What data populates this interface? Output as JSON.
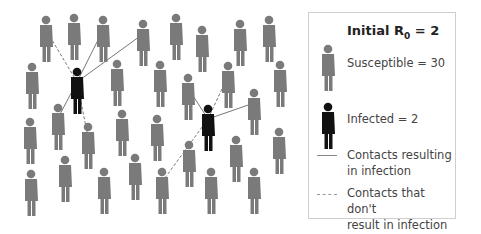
{
  "legend": {
    "title_prefix": "Initial R",
    "title_sub": "0",
    "title_suffix": " = 2",
    "susceptible_label": "Susceptible = 30",
    "infected_label": "Infected = 2",
    "solid_line_label_1": "Contacts resulting",
    "solid_line_label_2": "in infection",
    "dashed_line_label_1": "Contacts that don't",
    "dashed_line_label_2": "result in infection"
  },
  "colors": {
    "susceptible": "#7a7a7a",
    "infected": "#111111",
    "line": "#777777"
  },
  "susceptible_people": [
    [
      46,
      20
    ],
    [
      74,
      18
    ],
    [
      103,
      20
    ],
    [
      143,
      24
    ],
    [
      176,
      18
    ],
    [
      202,
      30
    ],
    [
      240,
      24
    ],
    [
      269,
      20
    ],
    [
      32,
      67
    ],
    [
      117,
      64
    ],
    [
      160,
      65
    ],
    [
      188,
      78
    ],
    [
      228,
      66
    ],
    [
      280,
      65
    ],
    [
      254,
      93
    ],
    [
      30,
      122
    ],
    [
      58,
      108
    ],
    [
      88,
      127
    ],
    [
      122,
      114
    ],
    [
      157,
      119
    ],
    [
      189,
      145
    ],
    [
      236,
      140
    ],
    [
      279,
      132
    ],
    [
      31,
      174
    ],
    [
      65,
      160
    ],
    [
      104,
      172
    ],
    [
      135,
      158
    ],
    [
      162,
      172
    ],
    [
      211,
      172
    ],
    [
      254,
      172
    ]
  ],
  "infected_people": [
    [
      77,
      72
    ],
    [
      208,
      109
    ]
  ],
  "contacts": [
    {
      "from": [
        77,
        72
      ],
      "to": [
        103,
        20
      ],
      "type": "solid"
    },
    {
      "from": [
        77,
        72
      ],
      "to": [
        143,
        24
      ],
      "type": "solid"
    },
    {
      "from": [
        77,
        72
      ],
      "to": [
        46,
        20
      ],
      "type": "dashed"
    },
    {
      "from": [
        77,
        72
      ],
      "to": [
        58,
        108
      ],
      "type": "solid"
    },
    {
      "from": [
        77,
        72
      ],
      "to": [
        88,
        127
      ],
      "type": "dashed"
    },
    {
      "from": [
        208,
        109
      ],
      "to": [
        188,
        78
      ],
      "type": "solid"
    },
    {
      "from": [
        208,
        109
      ],
      "to": [
        228,
        66
      ],
      "type": "dashed"
    },
    {
      "from": [
        208,
        109
      ],
      "to": [
        254,
        93
      ],
      "type": "solid"
    },
    {
      "from": [
        208,
        109
      ],
      "to": [
        162,
        172
      ],
      "type": "dashed"
    }
  ]
}
